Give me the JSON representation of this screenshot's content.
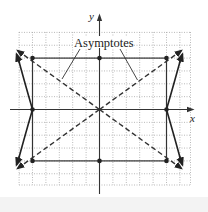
{
  "figure": {
    "type": "hyperbola-graph",
    "equation_implied": "x^2/25 - y^2/16 = 1",
    "x_axis_label": "x",
    "y_axis_label": "y",
    "annotation": "Asymptotes",
    "grid": {
      "x_min": -6,
      "x_max": 7,
      "y_min": -6,
      "y_max": 6,
      "step": 1,
      "style": "dotted"
    },
    "vertices": [
      [
        -5,
        0
      ],
      [
        5,
        0
      ]
    ],
    "co_vertices": [
      [
        0,
        4
      ],
      [
        0,
        -4
      ]
    ],
    "rectangle_corners": [
      [
        -5,
        4
      ],
      [
        5,
        4
      ],
      [
        5,
        -4
      ],
      [
        -5,
        -4
      ]
    ],
    "asymptotes": [
      "y = 4/5 x",
      "y = -4/5 x"
    ],
    "colors": {
      "curve": "#222222",
      "grid": "#9a9a9a",
      "axes": "#333333"
    }
  }
}
